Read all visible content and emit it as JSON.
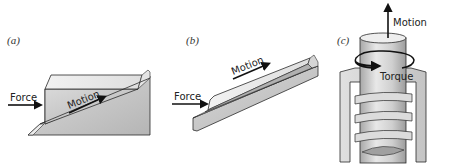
{
  "figure": {
    "panels": [
      {
        "id": "a",
        "label": "(a)",
        "description": "Block sliding up an inclined plane",
        "force_label": "Force",
        "motion_label": "Motion"
      },
      {
        "id": "b",
        "label": "(b)",
        "description": "Long wedge sliding along a grooved inclined rail",
        "force_label": "Force",
        "motion_label": "Motion"
      },
      {
        "id": "c",
        "label": "(c)",
        "description": "Screw turning inside a threaded nut",
        "motion_label": "Motion",
        "torque_label": "Torque"
      }
    ],
    "colors": {
      "background": "#ffffff",
      "surface_light": "#e6e6e6",
      "surface_mid": "#c8c8c8",
      "surface_dark": "#9a9a9a",
      "outline": "#2a2a2a",
      "arrow": "#111111"
    }
  }
}
